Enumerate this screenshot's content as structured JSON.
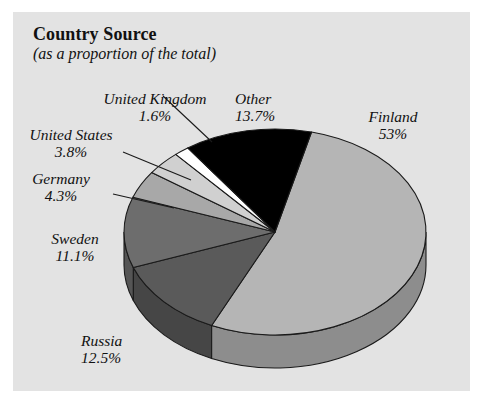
{
  "panel": {
    "background_color": "#e3e3e3",
    "page_background_color": "#ffffff"
  },
  "header": {
    "title": "Country Source",
    "subtitle": "(as a proportion of the total)"
  },
  "chart_data": {
    "type": "pie",
    "title": "Country Source",
    "subtitle": "(as a proportion of the total)",
    "xlabel": "",
    "ylabel": "",
    "legend_position": "none",
    "labels_inline": true,
    "three_d": true,
    "categories": [
      "Finland",
      "Other",
      "United Kingdom",
      "United States",
      "Germany",
      "Sweden",
      "Russia"
    ],
    "values": [
      53,
      13.7,
      1.6,
      3.8,
      4.3,
      11.1,
      12.5
    ],
    "value_labels": [
      "53%",
      "13.7%",
      "1.6%",
      "3.8%",
      "4.3%",
      "11.1%",
      "12.5%"
    ],
    "colors": [
      "#b5b5b5",
      "#000000",
      "#ffffff",
      "#d0d0d0",
      "#a8a8a8",
      "#6d6d6d",
      "#5a5a5a"
    ],
    "slices": [
      {
        "name": "Finland",
        "value": 53,
        "label": "Finland",
        "pct": "53%",
        "color": "#b5b5b5"
      },
      {
        "name": "Other",
        "value": 13.7,
        "label": "Other",
        "pct": "13.7%",
        "color": "#000000"
      },
      {
        "name": "United Kingdom",
        "value": 1.6,
        "label": "United Kingdom",
        "pct": "1.6%",
        "color": "#ffffff"
      },
      {
        "name": "United States",
        "value": 3.8,
        "label": "United States",
        "pct": "3.8%",
        "color": "#d0d0d0"
      },
      {
        "name": "Germany",
        "value": 4.3,
        "label": "Germany",
        "pct": "4.3%",
        "color": "#a8a8a8"
      },
      {
        "name": "Sweden",
        "value": 11.1,
        "label": "Sweden",
        "pct": "11.1%",
        "color": "#6d6d6d"
      },
      {
        "name": "Russia",
        "value": 12.5,
        "label": "Russia",
        "pct": "12.5%",
        "color": "#5a5a5a"
      }
    ]
  }
}
